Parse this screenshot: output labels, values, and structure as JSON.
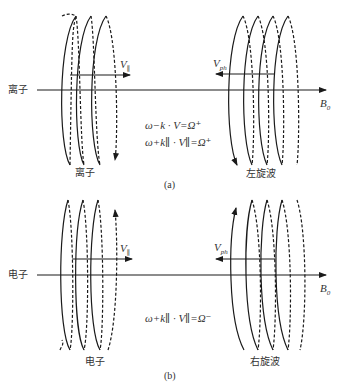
{
  "panel_a": {
    "particle_label_left": "离子",
    "particle_label_bottom": "离子",
    "wave_label": "左旋波",
    "velocity_label": "V",
    "velocity_sub": "∥",
    "phase_velocity_label": "V",
    "phase_velocity_sub": "ph",
    "field_label": "B",
    "field_sub": "0",
    "equation_1": "ω−k · V=Ω⁺",
    "equation_2": "ω+k∥ · V∥=Ω⁺",
    "caption": "(a)"
  },
  "panel_b": {
    "particle_label_left": "电子",
    "particle_label_bottom": "电子",
    "wave_label": "右旋波",
    "velocity_label": "V",
    "velocity_sub": "∥",
    "phase_velocity_label": "V",
    "phase_velocity_sub": "ph",
    "field_label": "B",
    "field_sub": "0",
    "equation_1": "ω+k∥ · V∥=Ω⁻",
    "caption": "(b)"
  },
  "colors": {
    "line": "#1a1a1a",
    "text": "#333333"
  }
}
